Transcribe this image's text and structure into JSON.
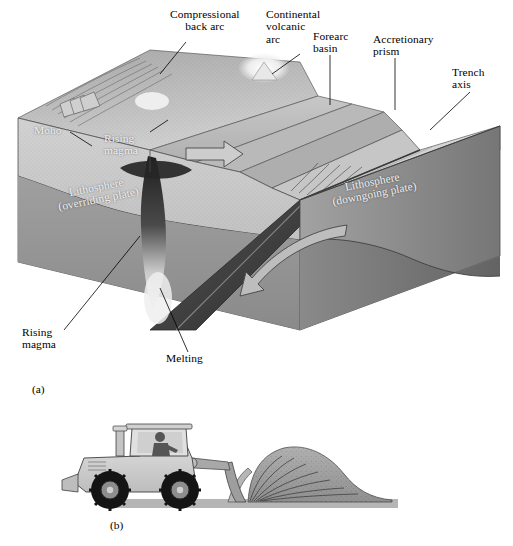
{
  "figure": {
    "panel_a": {
      "id": "(a)",
      "caption_labels": {
        "compressional_back_arc": "Compressional\nback arc",
        "continental_volcanic_arc": "Continental\nvolcanic\narc",
        "forearc_basin": "Forearc\nbasin",
        "accretionary_prism": "Accretionary\nprism",
        "trench_axis": "Trench\naxis",
        "moho": "Moho",
        "rising_magma_upper": "Rising\nmagma",
        "rising_magma_lower": "Rising\nmagma",
        "melting": "Melting",
        "lithosphere_overriding": "Lithosphere\n(overriding plate)",
        "lithosphere_downgoing": "Lithosphere\n(downgoing plate)"
      },
      "arrows": {
        "convergence_arrow": "right-arrow",
        "subduction_arrow": "curved-down-left-arrow"
      }
    },
    "panel_b": {
      "id": "(b)",
      "subject": "bulldozer-pushing-soil-wedge"
    }
  },
  "colors": {
    "background": "#ffffff",
    "text": "#000000",
    "text_light": "#f2f2f2",
    "surface_light": "#d8d8d8",
    "surface_mid": "#bfbfbf",
    "surface_dark": "#9a9a9a",
    "lithosphere_face": "#c4c4c4",
    "asthenosphere_face": "#8e8e8e",
    "slab_dark": "#6e6e6e",
    "ocean_plate": "#cfcfcf",
    "magma_dark": "#2b2b2b",
    "magma_light": "#f0f0f0",
    "dozer_body": "#c9c9c9",
    "dozer_dark": "#7d7d7d",
    "tire": "#141414",
    "soil": "#9e9e9e",
    "ground": "#b5b5b5"
  }
}
